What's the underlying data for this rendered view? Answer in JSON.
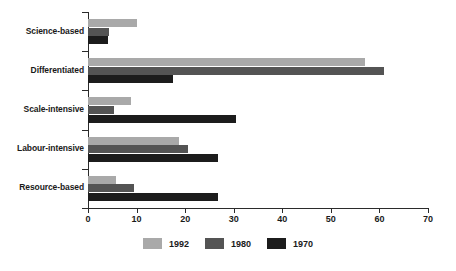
{
  "chart_data": {
    "type": "bar",
    "orientation": "horizontal",
    "title": "",
    "subtitle": "",
    "xlabel": "",
    "ylabel": "",
    "xlim": [
      0,
      70
    ],
    "ylim": null,
    "grid": false,
    "legend_position": "bottom-center",
    "xticks": [
      0,
      10,
      20,
      30,
      40,
      50,
      60,
      70
    ],
    "xticklabels": [
      "0",
      "10",
      "20",
      "30",
      "40",
      "50",
      "60",
      "70"
    ],
    "categories": [
      "Science-based",
      "Differentiated",
      "Scale-intensive",
      "Labour-intensive",
      "Resource-based"
    ],
    "series": [
      {
        "name": "1992",
        "color": "#a9a9a9",
        "values": [
          10.1,
          57.0,
          8.9,
          18.8,
          5.8
        ]
      },
      {
        "name": "1980",
        "color": "#545454",
        "values": [
          4.4,
          61.0,
          5.3,
          20.5,
          9.5
        ]
      },
      {
        "name": "1970",
        "color": "#1c1c1c",
        "values": [
          4.2,
          17.5,
          30.4,
          26.7,
          26.8
        ]
      }
    ]
  },
  "legend": {
    "items": [
      {
        "label": "1992",
        "swatch_class": "s1992"
      },
      {
        "label": "1980",
        "swatch_class": "s1980"
      },
      {
        "label": "1970",
        "swatch_class": "s1970"
      }
    ]
  }
}
